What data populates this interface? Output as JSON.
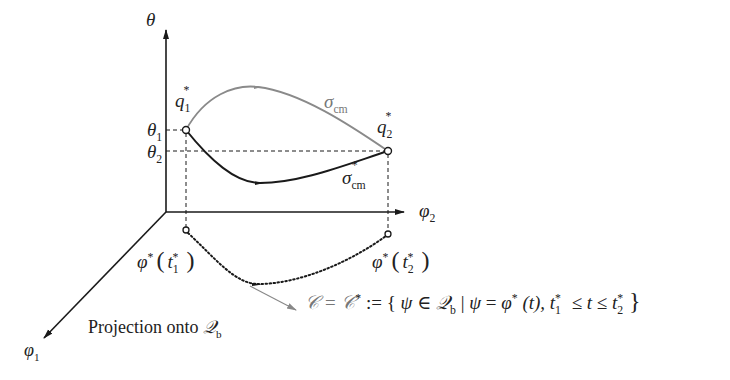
{
  "diagram": {
    "axes": {
      "theta_label": "θ",
      "phi1_label": "φ",
      "phi1_sub": "1",
      "phi2_label": "φ",
      "phi2_sub": "2"
    },
    "levels": {
      "theta1_label": "θ",
      "theta1_sub": "1",
      "theta2_label": "θ",
      "theta2_sub": "2"
    },
    "points": {
      "q1_label": "q",
      "q1_sub": "1",
      "q1_sup": "*",
      "q2_label": "q",
      "q2_sub": "2",
      "q2_sup": "*"
    },
    "curves": {
      "upper_label": "σ",
      "upper_sub": "cm",
      "lower_label": "σ",
      "lower_sub": "cm",
      "lower_sup": "*"
    },
    "projections": {
      "p1_label": "φ",
      "p1_sup": "*",
      "p1_arg": "t",
      "p1_arg_sub": "1",
      "p1_arg_sup": "*",
      "p2_label": "φ",
      "p2_sup": "*",
      "p2_arg": "t",
      "p2_arg_sub": "2",
      "p2_arg_sup": "*"
    },
    "caption_projection": "Projection onto",
    "caption_projection_space": "𝒬",
    "caption_projection_space_sub": "b",
    "set_definition": {
      "lhs": "𝒞 = 𝒞",
      "lhs_sup": "*",
      "assign": " := {",
      "psi": "ψ",
      "in": " ∈ ",
      "space": "𝒬",
      "space_sub": "b",
      "bar": " | ",
      "psi2": "ψ",
      "eq": " = ",
      "phi": "φ",
      "phi_sup": "*",
      "t_arg": " (t), ",
      "t1": "t",
      "t1_sub": "1",
      "t1_sup": "*",
      "le1": " ≤ t ≤ ",
      "t2": "t",
      "t2_sub": "2",
      "t2_sup": "*",
      "close": "}"
    },
    "colors": {
      "axis": "#1a1a1a",
      "upper_curve": "#8a8a8a",
      "lower_curve": "#1a1a1a",
      "pointer": "#888888"
    }
  }
}
